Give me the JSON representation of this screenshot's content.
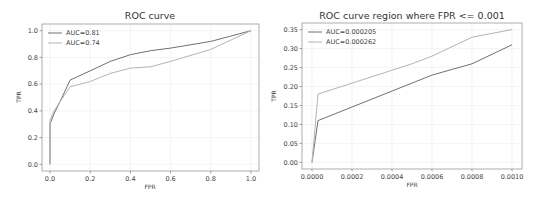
{
  "colors": {
    "series_dark": "#707070",
    "series_light": "#b4b4b4",
    "axis": "#999999",
    "grid": "#ececec"
  },
  "chart_data": [
    {
      "type": "line",
      "title": "ROC curve",
      "xlabel": "FPR",
      "ylabel": "TPR",
      "xlim": [
        -0.04,
        1.04
      ],
      "ylim": [
        -0.05,
        1.05
      ],
      "xticks": [
        0.0,
        0.2,
        0.4,
        0.6,
        0.8,
        1.0
      ],
      "xtick_labels": [
        "0.0",
        "0.2",
        "0.4",
        "0.6",
        "0.8",
        "1.0"
      ],
      "yticks": [
        0.0,
        0.2,
        0.4,
        0.6,
        0.8,
        1.0
      ],
      "ytick_labels": [
        "0.0",
        "0.2",
        "0.4",
        "0.6",
        "0.8",
        "1.0"
      ],
      "grid": true,
      "legend_position": "upper left",
      "series": [
        {
          "name": "AUC=0.81",
          "color": "#707070",
          "x": [
            0,
            0,
            0.02,
            0.05,
            0.1,
            0.2,
            0.3,
            0.4,
            0.5,
            0.6,
            0.8,
            1.0
          ],
          "y": [
            0,
            0.3,
            0.38,
            0.47,
            0.63,
            0.7,
            0.77,
            0.82,
            0.85,
            0.87,
            0.92,
            1.0
          ]
        },
        {
          "name": "AUC=0.74",
          "color": "#b4b4b4",
          "x": [
            0,
            0,
            0.02,
            0.05,
            0.1,
            0.2,
            0.3,
            0.4,
            0.5,
            0.6,
            0.8,
            1.0
          ],
          "y": [
            0,
            0.33,
            0.4,
            0.47,
            0.58,
            0.62,
            0.68,
            0.72,
            0.73,
            0.77,
            0.86,
            1.0
          ]
        }
      ]
    },
    {
      "type": "line",
      "title": "ROC curve region where FPR <= 0.001",
      "xlabel": "FPR",
      "ylabel": "TPR",
      "xlim": [
        -5e-05,
        0.00105
      ],
      "ylim": [
        -0.0175,
        0.3675
      ],
      "xticks": [
        0.0,
        0.0002,
        0.0004,
        0.0006,
        0.0008,
        0.001
      ],
      "xtick_labels": [
        "0.0000",
        "0.0002",
        "0.0004",
        "0.0006",
        "0.0008",
        "0.0010"
      ],
      "yticks": [
        0.0,
        0.05,
        0.1,
        0.15,
        0.2,
        0.25,
        0.3,
        0.35
      ],
      "ytick_labels": [
        "0.00",
        "0.05",
        "0.10",
        "0.15",
        "0.20",
        "0.25",
        "0.30",
        "0.35"
      ],
      "grid": true,
      "legend_position": "upper left",
      "series": [
        {
          "name": "AUC=0.000205",
          "color": "#707070",
          "x": [
            0,
            3e-05,
            0.0006,
            0.0008,
            0.001
          ],
          "y": [
            0,
            0.11,
            0.23,
            0.26,
            0.31
          ]
        },
        {
          "name": "AUC=0.000262",
          "color": "#b4b4b4",
          "x": [
            0,
            3e-05,
            0.0005,
            0.0006,
            0.0008,
            0.001
          ],
          "y": [
            0,
            0.18,
            0.26,
            0.28,
            0.33,
            0.35
          ]
        }
      ]
    }
  ]
}
